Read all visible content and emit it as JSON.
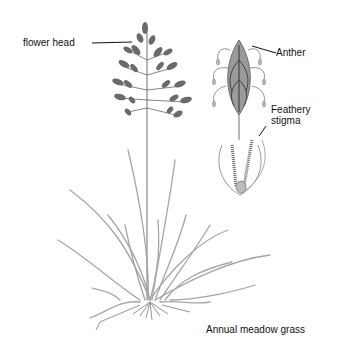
{
  "diagram": {
    "subject": "Annual meadow grass",
    "labels": {
      "flower_head": "flower head",
      "anther": "Anther",
      "feathery_stigma_line1": "Feathery",
      "feathery_stigma_line2": "stigma",
      "title": "Annual meadow grass"
    },
    "colors": {
      "background": "#ffffff",
      "ink": "#111111",
      "plant_dark": "#555555",
      "plant_light": "#9a9a9a"
    }
  }
}
